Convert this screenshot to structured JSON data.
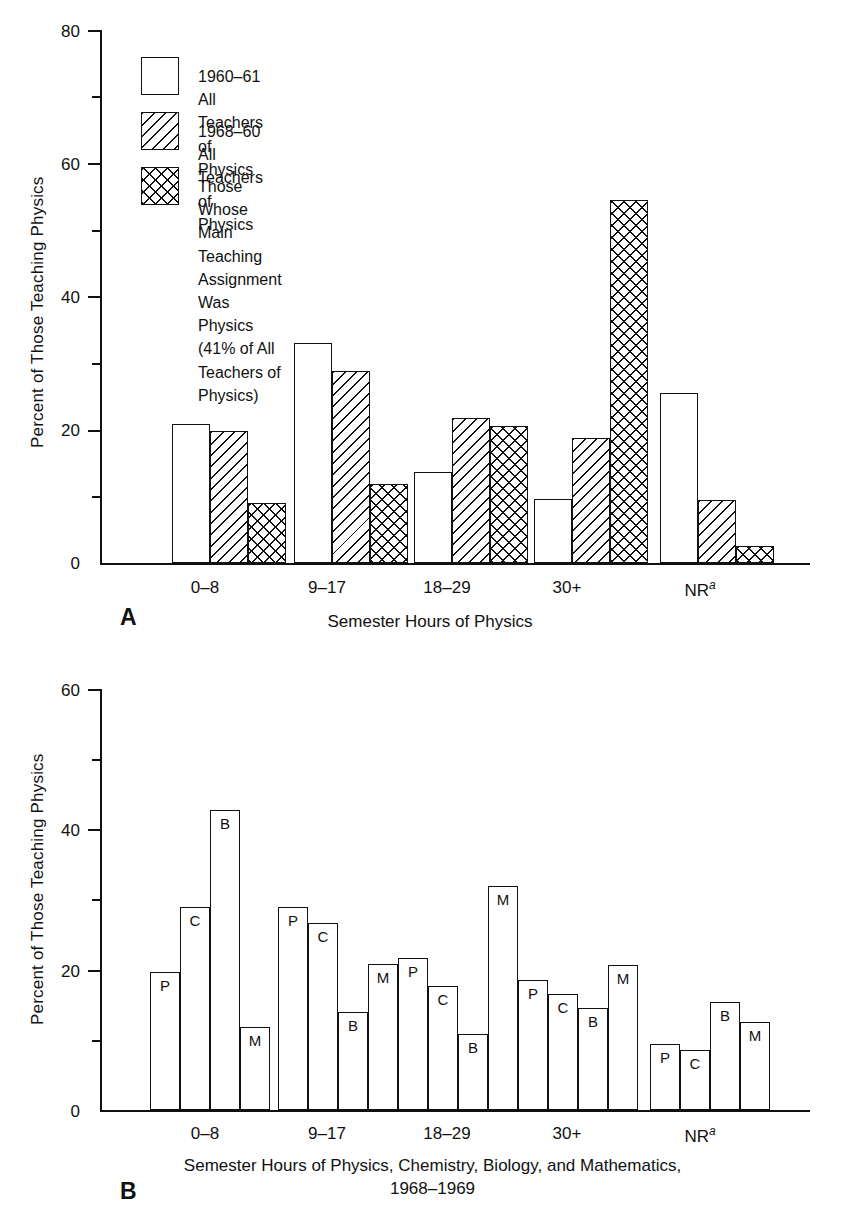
{
  "chart_data": [
    {
      "id": "panel-a",
      "type": "bar",
      "panel_letter": "A",
      "title": "",
      "xlabel": "Semester Hours of Physics",
      "ylabel": "Percent of Those Teaching Physics",
      "ylim": [
        0,
        80
      ],
      "ytick_labels": [
        "0",
        "20",
        "40",
        "60",
        "80"
      ],
      "ytick_values": [
        0,
        20,
        40,
        60,
        80
      ],
      "yminor_values": [
        10,
        30,
        50,
        70
      ],
      "grid": false,
      "legend_position": "upper-left inside",
      "categories": [
        "0–8",
        "9–17",
        "18–29",
        "30+",
        "NR"
      ],
      "category_superscripts": [
        "",
        "",
        "",
        "",
        "a"
      ],
      "series": [
        {
          "name": "1960–61 All Teachers of Physics",
          "fill": "open",
          "values": [
            20.9,
            33.0,
            13.7,
            9.6,
            25.5
          ]
        },
        {
          "name": "1968–60 All Teachers of Physics",
          "fill": "diagonal",
          "values": [
            19.8,
            28.8,
            21.7,
            18.7,
            9.5
          ]
        },
        {
          "name": "Those Whose Main Teaching Assignment Was Physics (41% of All Teachers of Physics)",
          "fill": "crosshatch",
          "values": [
            9.0,
            11.8,
            20.5,
            54.5,
            2.5
          ]
        }
      ],
      "legend": [
        {
          "fill": "open",
          "label": "1960–61 All Teachers of Physics"
        },
        {
          "fill": "diagonal",
          "label": "1968–60 All Teachers of Physics"
        },
        {
          "fill": "crosshatch",
          "label": "Those Whose Main Teaching Assignment Was Physics\n(41% of All Teachers of Physics)"
        }
      ]
    },
    {
      "id": "panel-b",
      "type": "bar",
      "panel_letter": "B",
      "title": "",
      "xlabel_line1": "Semester Hours of Physics, Chemistry, Biology, and Mathematics,",
      "xlabel_line2": "1968–1969",
      "ylabel": "Percent of Those Teaching Physics",
      "ylim": [
        0,
        60
      ],
      "ytick_labels": [
        "0",
        "20",
        "40",
        "60"
      ],
      "ytick_values": [
        0,
        20,
        40,
        60
      ],
      "yminor_values": [
        10,
        30,
        50
      ],
      "grid": false,
      "legend_position": "none",
      "categories": [
        "0–8",
        "9–17",
        "18–29",
        "30+",
        "NR"
      ],
      "category_superscripts": [
        "",
        "",
        "",
        "",
        "a"
      ],
      "series": [
        {
          "name": "P",
          "letter": "P",
          "values": [
            19.7,
            28.9,
            21.7,
            18.5,
            9.4
          ]
        },
        {
          "name": "C",
          "letter": "C",
          "values": [
            28.9,
            26.6,
            17.7,
            16.5,
            8.5
          ]
        },
        {
          "name": "B",
          "letter": "B",
          "values": [
            42.8,
            14.0,
            10.8,
            14.6,
            15.4
          ]
        },
        {
          "name": "M",
          "letter": "M",
          "values": [
            11.9,
            20.8,
            31.9,
            20.6,
            12.5
          ]
        }
      ]
    }
  ],
  "colors": {
    "ink": "#111111",
    "background": "#ffffff"
  }
}
